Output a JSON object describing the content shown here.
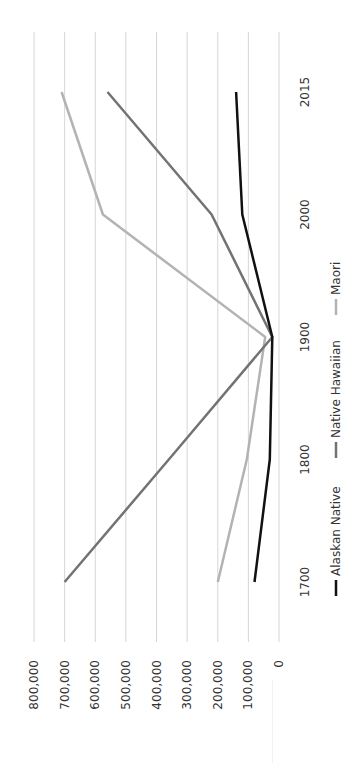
{
  "chart_data": {
    "type": "line",
    "title": "",
    "xlabel": "",
    "ylabel": "",
    "rotation": "chart rotated 90 degrees clockwise (value axis horizontal at bottom, categories vertical)",
    "categories": [
      "1700",
      "1800",
      "1900",
      "2000",
      "2015"
    ],
    "series": [
      {
        "name": "Alaskan Native",
        "color": "#111111",
        "values": [
          80000,
          30000,
          22000,
          120000,
          140000
        ]
      },
      {
        "name": "Native Hawaiian",
        "color": "#737373",
        "values": [
          700000,
          360000,
          22000,
          220000,
          560000
        ]
      },
      {
        "name": "Maori",
        "color": "#b3b3b3",
        "values": [
          200000,
          105000,
          45000,
          575000,
          710000
        ]
      }
    ],
    "ylim": [
      0,
      800000
    ],
    "yticks": [
      "0",
      "100,000",
      "200,000",
      "300,000",
      "400,000",
      "500,000",
      "600,000",
      "700,000",
      "800,000"
    ],
    "grid": true,
    "legend_position": "bottom"
  }
}
